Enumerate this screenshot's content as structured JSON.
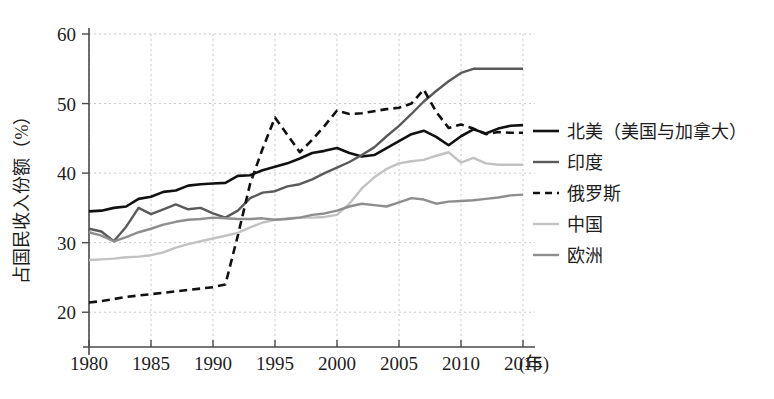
{
  "chart_data": {
    "type": "line",
    "title": "",
    "xlabel": "(年)",
    "ylabel": "占国民收入份额（%）",
    "xlim": [
      1980,
      2015
    ],
    "ylim": [
      15,
      60
    ],
    "grid": true,
    "legend_position": "right",
    "x_ticks": [
      "1980",
      "1985",
      "1990",
      "1995",
      "2000",
      "2005",
      "2010",
      "2015"
    ],
    "x_tick_values": [
      1980,
      1985,
      1990,
      1995,
      2000,
      2005,
      2010,
      2015
    ],
    "y_ticks": [
      "20",
      "30",
      "40",
      "50",
      "60"
    ],
    "y_tick_values": [
      20,
      30,
      40,
      50,
      60
    ],
    "x": [
      1980,
      1981,
      1982,
      1983,
      1984,
      1985,
      1986,
      1987,
      1988,
      1989,
      1990,
      1991,
      1992,
      1993,
      1994,
      1995,
      1996,
      1997,
      1998,
      1999,
      2000,
      2001,
      2002,
      2003,
      2004,
      2005,
      2006,
      2007,
      2008,
      2009,
      2010,
      2011,
      2012,
      2013,
      2014,
      2015
    ],
    "series": [
      {
        "name": "北美（美国与加拿大）",
        "color": "#111111",
        "width": 2.6,
        "dash": "none",
        "values": [
          34.5,
          34.6,
          35.0,
          35.2,
          36.3,
          36.6,
          37.3,
          37.5,
          38.2,
          38.4,
          38.5,
          38.6,
          39.6,
          39.7,
          40.4,
          40.9,
          41.4,
          42.1,
          42.9,
          43.2,
          43.6,
          42.9,
          42.4,
          42.6,
          43.6,
          44.6,
          45.6,
          46.1,
          45.2,
          44.0,
          45.3,
          46.3,
          45.7,
          46.4,
          46.8,
          46.9
        ]
      },
      {
        "name": "印度",
        "color": "#5a5a5a",
        "width": 2.4,
        "dash": "none",
        "values": [
          32.0,
          31.6,
          30.2,
          32.3,
          35.0,
          34.1,
          34.8,
          35.5,
          34.8,
          35.0,
          34.2,
          33.6,
          34.6,
          36.4,
          37.2,
          37.4,
          38.1,
          38.4,
          39.1,
          40.0,
          40.8,
          41.6,
          42.6,
          43.7,
          45.3,
          46.8,
          48.5,
          50.3,
          51.8,
          53.2,
          54.4,
          55.0,
          55.0,
          55.0,
          55.0,
          55.0
        ]
      },
      {
        "name": "俄罗斯",
        "color": "#111111",
        "width": 2.6,
        "dash": "8 5",
        "values": [
          21.4,
          21.6,
          21.9,
          22.2,
          22.4,
          22.6,
          22.8,
          23.0,
          23.2,
          23.4,
          23.6,
          24.0,
          31.0,
          38.5,
          43.5,
          48.0,
          45.5,
          43.0,
          44.8,
          46.8,
          49.0,
          48.5,
          48.6,
          48.9,
          49.2,
          49.4,
          50.0,
          52.0,
          48.8,
          46.5,
          47.0,
          46.4,
          45.6,
          45.9,
          45.8,
          45.8
        ]
      },
      {
        "name": "中国",
        "color": "#c2c2c2",
        "width": 2.4,
        "dash": "none",
        "values": [
          27.5,
          27.6,
          27.7,
          27.9,
          28.0,
          28.2,
          28.6,
          29.3,
          29.8,
          30.2,
          30.6,
          31.0,
          31.4,
          32.2,
          32.9,
          33.3,
          33.5,
          33.6,
          33.6,
          33.7,
          34.0,
          35.6,
          37.8,
          39.4,
          40.6,
          41.4,
          41.7,
          41.9,
          42.5,
          43.0,
          41.5,
          42.2,
          41.4,
          41.2,
          41.2,
          41.2
        ]
      },
      {
        "name": "欧洲",
        "color": "#8e8e8e",
        "width": 2.4,
        "dash": "none",
        "values": [
          31.5,
          31.0,
          30.2,
          30.8,
          31.5,
          32.0,
          32.6,
          33.0,
          33.3,
          33.4,
          33.6,
          33.5,
          33.4,
          33.4,
          33.5,
          33.3,
          33.4,
          33.6,
          34.0,
          34.2,
          34.6,
          35.2,
          35.6,
          35.4,
          35.2,
          35.8,
          36.4,
          36.2,
          35.6,
          35.9,
          36.0,
          36.1,
          36.3,
          36.5,
          36.8,
          36.9
        ]
      }
    ]
  },
  "legend": {
    "items": [
      {
        "label": "北美（美国与加拿大）"
      },
      {
        "label": "印度"
      },
      {
        "label": "俄罗斯"
      },
      {
        "label": "中国"
      },
      {
        "label": "欧洲"
      }
    ]
  },
  "axes": {
    "y_title": "占国民收入份额（%）",
    "x_unit": "(年)"
  }
}
